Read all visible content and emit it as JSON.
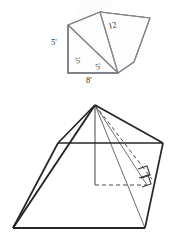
{
  "figures": {
    "prism": {
      "name": "triangular-prism",
      "labels": {
        "height": "5'",
        "base": "8'",
        "slant_left": "5'",
        "slant_right": "5'",
        "depth": "12"
      },
      "geometry": {
        "front_triangle": [
          [
            68,
            25
          ],
          [
            68,
            73
          ],
          [
            118,
            73
          ]
        ],
        "depth_vector": [
          32,
          -55
        ],
        "stroke": "#7e7e86",
        "fill": "#fdfdfd"
      }
    },
    "pyramid": {
      "name": "rectangular-pyramid",
      "labels": {},
      "geometry": {
        "base": [
          [
            58,
            143
          ],
          [
            163,
            143
          ],
          [
            145,
            228
          ],
          [
            13,
            228
          ]
        ],
        "apex": [
          95,
          105
        ],
        "altitude_foot": [
          95,
          185
        ],
        "dashed_foot_to_right": [
          [
            95,
            185
          ],
          [
            147,
            185
          ]
        ],
        "right_angle_marks": 2,
        "stroke_outer": "#262626",
        "stroke_inner": "#5a5a5a",
        "stroke_dashed": "#4a4a4a"
      }
    }
  },
  "colors": {
    "page_background": "#ffffff",
    "ink_dark": "#262626",
    "ink_mid": "#5a5a5a",
    "ink_light": "#7e7e86",
    "label_text": "#2a2a2a"
  }
}
